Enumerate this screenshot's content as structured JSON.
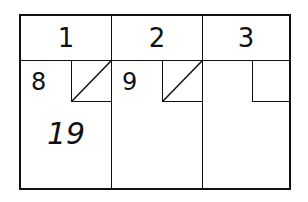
{
  "scorecard": {
    "frames": [
      {
        "number": "1",
        "first_roll": "8",
        "second_roll": "spare",
        "total": "19"
      },
      {
        "number": "2",
        "first_roll": "9",
        "second_roll": "spare",
        "total": ""
      },
      {
        "number": "3",
        "first_roll": "",
        "second_roll": "",
        "total": ""
      }
    ]
  }
}
